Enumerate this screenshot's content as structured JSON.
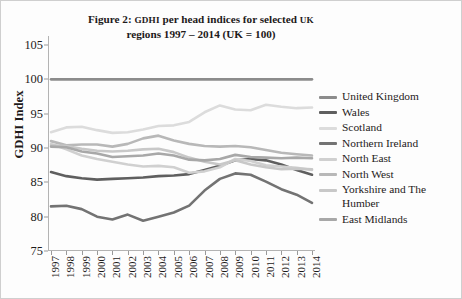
{
  "figure": {
    "title_line1_prefix": "Figure 2: ",
    "title_line1_sc1": "GDHI",
    "title_line1_mid": " per head indices for selected ",
    "title_line1_sc2": "UK",
    "title_line2": "regions 1997 – 2014 (UK = 100)",
    "ylabel": "GDHI Index"
  },
  "legend": {
    "items": [
      {
        "label": "United Kingdom",
        "color": "#8c8c8c"
      },
      {
        "label": "Wales",
        "color": "#5f5f5f"
      },
      {
        "label": "Scotland",
        "color": "#dcdcdc"
      },
      {
        "label": "Northern Ireland",
        "color": "#737373"
      },
      {
        "label": "North East",
        "color": "#d0d0d0"
      },
      {
        "label": "North West",
        "color": "#b8b8b8"
      },
      {
        "label": "Yorkshire and The Humber",
        "color": "#c8c8c8"
      },
      {
        "label": "East Midlands",
        "color": "#a8a8a8"
      }
    ]
  },
  "chart_data": {
    "type": "line",
    "title": "Figure 2: GDHI per head indices for selected UK regions 1997 – 2014 (UK = 100)",
    "xlabel": "",
    "ylabel": "GDHI Index",
    "ylim": [
      75,
      105
    ],
    "yticks": [
      75,
      80,
      85,
      90,
      95,
      100,
      105
    ],
    "grid": false,
    "legend_position": "right",
    "categories": [
      1997,
      1998,
      1999,
      2000,
      2001,
      2002,
      2003,
      2004,
      2005,
      2006,
      2007,
      2008,
      2009,
      2010,
      2011,
      2012,
      2013,
      2014
    ],
    "series": [
      {
        "name": "United Kingdom",
        "color": "#8c8c8c",
        "values": [
          100,
          100,
          100,
          100,
          100,
          100,
          100,
          100,
          100,
          100,
          100,
          100,
          100,
          100,
          100,
          100,
          100,
          100
        ]
      },
      {
        "name": "Wales",
        "color": "#5f5f5f",
        "values": [
          86.5,
          85.9,
          85.6,
          85.4,
          85.5,
          85.6,
          85.7,
          85.9,
          86.0,
          86.2,
          86.8,
          87.4,
          88.2,
          88.4,
          88.2,
          87.6,
          86.8,
          86.1
        ]
      },
      {
        "name": "Scotland",
        "color": "#dcdcdc",
        "values": [
          92.3,
          93.0,
          93.1,
          92.6,
          92.2,
          92.3,
          92.7,
          93.2,
          93.3,
          93.8,
          95.2,
          96.2,
          95.6,
          95.5,
          96.3,
          96.0,
          95.8,
          95.9
        ]
      },
      {
        "name": "Northern Ireland",
        "color": "#737373",
        "values": [
          81.5,
          81.6,
          81.1,
          80.0,
          79.6,
          80.3,
          79.4,
          80.0,
          80.6,
          81.6,
          83.8,
          85.5,
          86.3,
          86.1,
          85.1,
          84.0,
          83.2,
          82.0
        ]
      },
      {
        "name": "North East",
        "color": "#d0d0d0",
        "values": [
          90.6,
          89.8,
          88.9,
          88.4,
          88.0,
          87.6,
          87.3,
          87.4,
          87.2,
          86.4,
          86.6,
          87.2,
          88.4,
          88.1,
          87.5,
          87.3,
          87.1,
          86.8
        ]
      },
      {
        "name": "North West",
        "color": "#b8b8b8",
        "values": [
          91.0,
          90.4,
          90.5,
          90.5,
          90.2,
          90.6,
          91.4,
          91.8,
          91.1,
          90.6,
          90.3,
          90.2,
          90.3,
          90.1,
          89.7,
          89.3,
          89.1,
          88.9
        ]
      },
      {
        "name": "Yorkshire and The Humber",
        "color": "#c8c8c8",
        "values": [
          90.4,
          90.3,
          89.9,
          89.6,
          89.5,
          89.6,
          89.8,
          89.9,
          89.4,
          88.6,
          88.0,
          87.6,
          88.2,
          87.6,
          87.2,
          86.9,
          87.0,
          86.9
        ]
      },
      {
        "name": "East Midlands",
        "color": "#a8a8a8",
        "values": [
          90.2,
          90.1,
          89.5,
          89.2,
          88.7,
          88.8,
          88.9,
          89.2,
          88.9,
          88.3,
          88.2,
          88.4,
          89.0,
          88.7,
          88.6,
          88.5,
          88.6,
          88.5
        ]
      }
    ]
  }
}
